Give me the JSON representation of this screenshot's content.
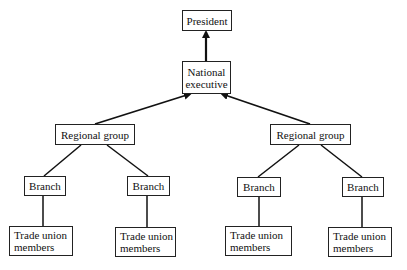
{
  "diagram": {
    "type": "organizational-hierarchy",
    "nodes": {
      "president": "President",
      "national_executive": "National\nexecutive",
      "regional_left": "Regional group",
      "regional_right": "Regional group",
      "branch_1": "Branch",
      "branch_2": "Branch",
      "branch_3": "Branch",
      "branch_4": "Branch",
      "members_1": "Trade union\nmembers",
      "members_2": "Trade union\nmembers",
      "members_3": "Trade union\nmembers",
      "members_4": "Trade union\nmembers"
    },
    "edges": [
      {
        "from": "national_executive",
        "to": "president",
        "arrow": true
      },
      {
        "from": "regional_left",
        "to": "national_executive",
        "arrow": true
      },
      {
        "from": "regional_right",
        "to": "national_executive",
        "arrow": true
      },
      {
        "from": "branch_1",
        "to": "regional_left",
        "arrow": false
      },
      {
        "from": "branch_2",
        "to": "regional_left",
        "arrow": false
      },
      {
        "from": "branch_3",
        "to": "regional_right",
        "arrow": false
      },
      {
        "from": "branch_4",
        "to": "regional_right",
        "arrow": false
      },
      {
        "from": "members_1",
        "to": "branch_1",
        "arrow": false
      },
      {
        "from": "members_2",
        "to": "branch_2",
        "arrow": false
      },
      {
        "from": "members_3",
        "to": "branch_3",
        "arrow": false
      },
      {
        "from": "members_4",
        "to": "branch_4",
        "arrow": false
      }
    ]
  }
}
